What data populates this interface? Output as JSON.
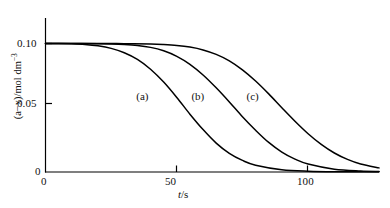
{
  "chart_data": {
    "type": "line",
    "title": "",
    "subtitle": "",
    "xlabel": "t/s",
    "xlabel_parts": {
      "symbol": "t",
      "unit": "/s"
    },
    "ylabel": "(a−x)/mol dm⁻³",
    "ylabel_parts": {
      "quantity": "(a−x)",
      "unit": "/mol dm",
      "exponent": "−3"
    },
    "xlim": [
      0,
      127
    ],
    "ylim": [
      0,
      0.1075
    ],
    "xticks": [
      0,
      50,
      100
    ],
    "xtick_labels": [
      "0",
      "50",
      "100"
    ],
    "yticks": [
      0,
      0.05,
      0.1
    ],
    "ytick_labels": [
      "0",
      "0.05",
      "0.10"
    ],
    "grid": false,
    "legend": "inline-curve-labels",
    "line_color": "#000000",
    "background_color": "#ffffff",
    "axis_color": "#000000",
    "series": [
      {
        "name": "(a)",
        "label": "(a)",
        "label_position": {
          "t": 38,
          "value": 0.0585
        },
        "x": [
          0,
          5,
          10,
          15,
          20,
          25,
          30,
          35,
          40,
          45,
          50,
          55,
          60,
          65,
          70,
          75,
          80,
          90,
          100,
          110,
          127
        ],
        "values": [
          0.1,
          0.1,
          0.0998,
          0.0993,
          0.0982,
          0.0962,
          0.0928,
          0.0876,
          0.08,
          0.07,
          0.058,
          0.045,
          0.033,
          0.0225,
          0.0145,
          0.009,
          0.0053,
          0.0018,
          0.0006,
          0.0002,
          0.0001
        ]
      },
      {
        "name": "(b)",
        "label": "(b)",
        "label_position": {
          "t": 59,
          "value": 0.0585
        },
        "x": [
          0,
          10,
          20,
          25,
          30,
          35,
          40,
          45,
          50,
          55,
          60,
          65,
          70,
          75,
          80,
          85,
          90,
          95,
          100,
          110,
          120,
          127
        ],
        "values": [
          0.1,
          0.1,
          0.0999,
          0.0997,
          0.0993,
          0.0985,
          0.097,
          0.0943,
          0.09,
          0.0838,
          0.0755,
          0.0655,
          0.0545,
          0.043,
          0.0325,
          0.023,
          0.0155,
          0.01,
          0.0062,
          0.0022,
          0.0008,
          0.0004
        ]
      },
      {
        "name": "(c)",
        "label": "(c)",
        "label_position": {
          "t": 80,
          "value": 0.0585
        },
        "x": [
          0,
          20,
          30,
          40,
          45,
          50,
          55,
          60,
          65,
          70,
          75,
          80,
          85,
          90,
          95,
          100,
          105,
          110,
          115,
          120,
          127
        ],
        "values": [
          0.1,
          0.1,
          0.0999,
          0.0996,
          0.0992,
          0.0985,
          0.0972,
          0.095,
          0.0915,
          0.0865,
          0.0795,
          0.0708,
          0.0608,
          0.05,
          0.0395,
          0.0298,
          0.0215,
          0.0148,
          0.0098,
          0.0062,
          0.0032
        ]
      }
    ]
  }
}
